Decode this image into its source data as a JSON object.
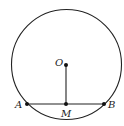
{
  "diagram": {
    "type": "geometry",
    "circle": {
      "cx": 66.5,
      "cy": 64.5,
      "r": 55,
      "stroke": "#222222"
    },
    "points": {
      "O": {
        "label": "O",
        "x": 66,
        "y": 65
      },
      "A": {
        "label": "A",
        "x": 27,
        "y": 104
      },
      "B": {
        "label": "B",
        "x": 104,
        "y": 104
      },
      "M": {
        "label": "M",
        "x": 66,
        "y": 104
      }
    },
    "segments": [
      {
        "from": "A",
        "to": "B"
      },
      {
        "from": "O",
        "to": "M"
      }
    ]
  }
}
